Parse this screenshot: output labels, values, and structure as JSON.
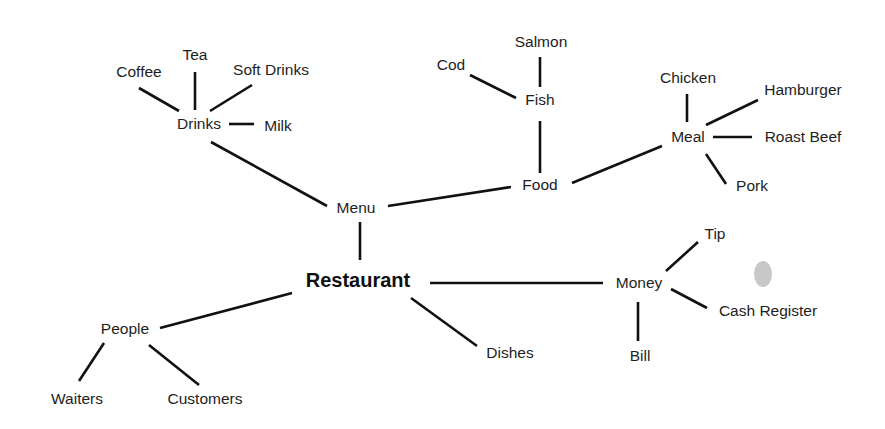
{
  "diagram": {
    "root": "restaurant",
    "nodes": [
      {
        "id": "restaurant",
        "label": "Restaurant",
        "x": 358,
        "y": 282,
        "root": true
      },
      {
        "id": "menu",
        "label": "Menu",
        "x": 356,
        "y": 209
      },
      {
        "id": "drinks",
        "label": "Drinks",
        "x": 199,
        "y": 125
      },
      {
        "id": "coffee",
        "label": "Coffee",
        "x": 139,
        "y": 73
      },
      {
        "id": "tea",
        "label": "Tea",
        "x": 195,
        "y": 56
      },
      {
        "id": "soft_drinks",
        "label": "Soft Drinks",
        "x": 271,
        "y": 71
      },
      {
        "id": "milk",
        "label": "Milk",
        "x": 278,
        "y": 127
      },
      {
        "id": "food",
        "label": "Food",
        "x": 540,
        "y": 186
      },
      {
        "id": "fish",
        "label": "Fish",
        "x": 540,
        "y": 101
      },
      {
        "id": "salmon",
        "label": "Salmon",
        "x": 541,
        "y": 43
      },
      {
        "id": "cod",
        "label": "Cod",
        "x": 451,
        "y": 66
      },
      {
        "id": "meal",
        "label": "Meal",
        "x": 688,
        "y": 138
      },
      {
        "id": "chicken",
        "label": "Chicken",
        "x": 688,
        "y": 79
      },
      {
        "id": "hamburger",
        "label": "Hamburger",
        "x": 803,
        "y": 91
      },
      {
        "id": "roast_beef",
        "label": "Roast Beef",
        "x": 803,
        "y": 138
      },
      {
        "id": "pork",
        "label": "Pork",
        "x": 752,
        "y": 187
      },
      {
        "id": "people",
        "label": "People",
        "x": 125,
        "y": 330
      },
      {
        "id": "waiters",
        "label": "Waiters",
        "x": 77,
        "y": 400
      },
      {
        "id": "customers",
        "label": "Customers",
        "x": 205,
        "y": 400
      },
      {
        "id": "dishes",
        "label": "Dishes",
        "x": 510,
        "y": 354
      },
      {
        "id": "money",
        "label": "Money",
        "x": 639,
        "y": 284
      },
      {
        "id": "tip",
        "label": "Tip",
        "x": 715,
        "y": 235
      },
      {
        "id": "cash_register",
        "label": "Cash Register",
        "x": 768,
        "y": 312
      },
      {
        "id": "bill",
        "label": "Bill",
        "x": 640,
        "y": 357
      }
    ],
    "edges": [
      {
        "from": "coffee",
        "to": "drinks",
        "x1": 139,
        "y1": 88,
        "x2": 179,
        "y2": 111
      },
      {
        "from": "tea",
        "to": "drinks",
        "x1": 195,
        "y1": 72,
        "x2": 195,
        "y2": 110
      },
      {
        "from": "soft_drinks",
        "to": "drinks",
        "x1": 252,
        "y1": 85,
        "x2": 210,
        "y2": 111
      },
      {
        "from": "drinks",
        "to": "milk",
        "x1": 229,
        "y1": 124,
        "x2": 254,
        "y2": 124
      },
      {
        "from": "drinks",
        "to": "menu",
        "x1": 211,
        "y1": 142,
        "x2": 327,
        "y2": 206
      },
      {
        "from": "menu",
        "to": "food",
        "x1": 388,
        "y1": 206,
        "x2": 511,
        "y2": 187
      },
      {
        "from": "cod",
        "to": "fish",
        "x1": 470,
        "y1": 75,
        "x2": 516,
        "y2": 98
      },
      {
        "from": "salmon",
        "to": "fish",
        "x1": 540,
        "y1": 57,
        "x2": 540,
        "y2": 87
      },
      {
        "from": "fish",
        "to": "food",
        "x1": 540,
        "y1": 121,
        "x2": 540,
        "y2": 173
      },
      {
        "from": "food",
        "to": "meal",
        "x1": 572,
        "y1": 183,
        "x2": 662,
        "y2": 146
      },
      {
        "from": "chicken",
        "to": "meal",
        "x1": 687,
        "y1": 94,
        "x2": 687,
        "y2": 122
      },
      {
        "from": "meal",
        "to": "hamburger",
        "x1": 706,
        "y1": 125,
        "x2": 758,
        "y2": 100
      },
      {
        "from": "meal",
        "to": "roast_beef",
        "x1": 713,
        "y1": 137,
        "x2": 752,
        "y2": 137
      },
      {
        "from": "meal",
        "to": "pork",
        "x1": 706,
        "y1": 154,
        "x2": 726,
        "y2": 184
      },
      {
        "from": "menu",
        "to": "restaurant",
        "x1": 360,
        "y1": 222,
        "x2": 360,
        "y2": 260
      },
      {
        "from": "restaurant",
        "to": "people",
        "x1": 292,
        "y1": 293,
        "x2": 160,
        "y2": 328
      },
      {
        "from": "people",
        "to": "waiters",
        "x1": 104,
        "y1": 343,
        "x2": 79,
        "y2": 381
      },
      {
        "from": "people",
        "to": "customers",
        "x1": 149,
        "y1": 345,
        "x2": 199,
        "y2": 385
      },
      {
        "from": "restaurant",
        "to": "money",
        "x1": 430,
        "y1": 283,
        "x2": 603,
        "y2": 283
      },
      {
        "from": "restaurant",
        "to": "dishes",
        "x1": 411,
        "y1": 298,
        "x2": 477,
        "y2": 346
      },
      {
        "from": "money",
        "to": "tip",
        "x1": 666,
        "y1": 271,
        "x2": 698,
        "y2": 242
      },
      {
        "from": "money",
        "to": "cash_register",
        "x1": 671,
        "y1": 289,
        "x2": 707,
        "y2": 308
      },
      {
        "from": "money",
        "to": "bill",
        "x1": 638,
        "y1": 302,
        "x2": 638,
        "y2": 341
      }
    ]
  },
  "colors": {
    "background": "#ffffff",
    "line": "#111111",
    "text": "#1e1e1e"
  }
}
